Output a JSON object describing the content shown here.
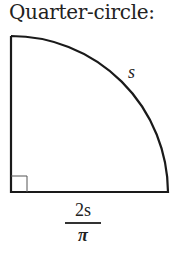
{
  "title": "Quarter-circle:",
  "figure": {
    "shape": "quarter-circle",
    "arc_label": "s",
    "base_label": {
      "numerator": "2s",
      "denominator": "π"
    },
    "right_angle_marker": true,
    "stroke_color": "#1a1a1a"
  }
}
